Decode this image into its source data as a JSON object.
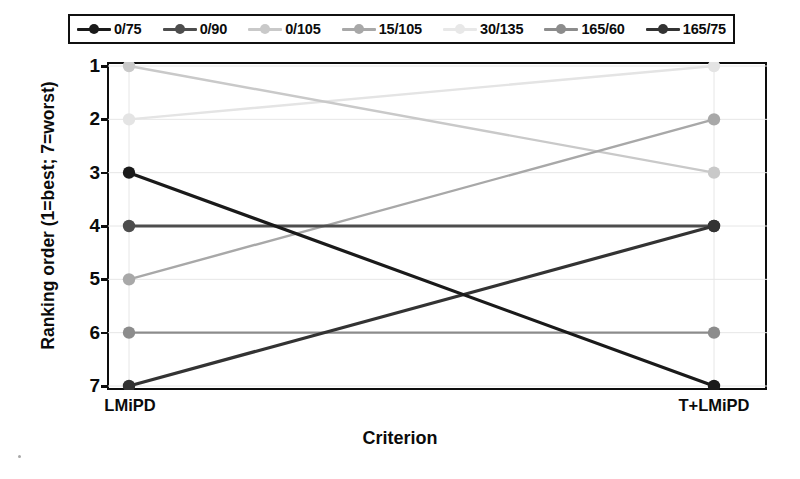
{
  "chart_data": {
    "type": "line",
    "title": "",
    "xlabel": "Criterion",
    "ylabel": "Ranking order (1=best; 7=worst)",
    "categories": [
      "LMiPD",
      "T+LMiPD"
    ],
    "x_tick_labels": [
      "LMiPD",
      "T+LMiPD"
    ],
    "y_tick_labels": [
      "1",
      "2",
      "3",
      "4",
      "5",
      "6",
      "7"
    ],
    "ylim": [
      1,
      7
    ],
    "y_inverted": true,
    "grid": true,
    "legend_position": "top",
    "series": [
      {
        "name": "0/75",
        "values": [
          3,
          7
        ],
        "color": "#1a1a1a"
      },
      {
        "name": "0/90",
        "values": [
          4,
          4
        ],
        "color": "#4d4d4d"
      },
      {
        "name": "0/105",
        "values": [
          1,
          3
        ],
        "color": "#c9c9c9"
      },
      {
        "name": "15/105",
        "values": [
          5,
          2
        ],
        "color": "#a8a8a8"
      },
      {
        "name": "30/135",
        "values": [
          2,
          1
        ],
        "color": "#e4e4e4"
      },
      {
        "name": "165/60",
        "values": [
          6,
          6
        ],
        "color": "#8c8c8c"
      },
      {
        "name": "165/75",
        "values": [
          7,
          4
        ],
        "color": "#333333"
      }
    ]
  },
  "legend": {
    "items": [
      {
        "label": "0/75",
        "color": "#1a1a1a"
      },
      {
        "label": "0/90",
        "color": "#4d4d4d"
      },
      {
        "label": "0/105",
        "color": "#c9c9c9"
      },
      {
        "label": "15/105",
        "color": "#a8a8a8"
      },
      {
        "label": "30/135",
        "color": "#e8e8e8"
      },
      {
        "label": "165/60",
        "color": "#8c8c8c"
      },
      {
        "label": "165/75",
        "color": "#333333"
      }
    ]
  },
  "axes": {
    "y_title": "Ranking order (1=best; 7=worst)",
    "x_title": "Criterion",
    "y_ticks": [
      "1",
      "2",
      "3",
      "4",
      "5",
      "6",
      "7"
    ],
    "x_ticks": [
      "LMiPD",
      "T+LMiPD"
    ]
  },
  "colors": {
    "axis": "#0d0d0d",
    "grid": "#e6e6e6",
    "background": "#ffffff",
    "text": "#0b0b0b"
  }
}
